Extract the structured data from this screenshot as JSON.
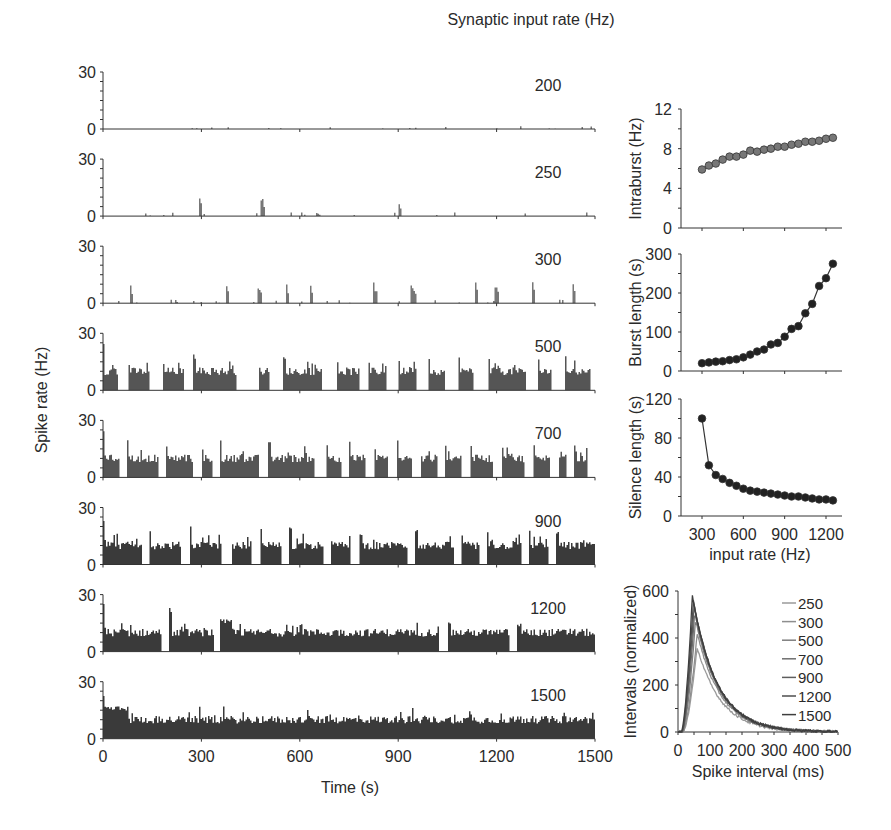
{
  "figure": {
    "header": "Synaptic input rate (Hz)",
    "left_ylabel": "Spike rate (Hz)",
    "left_xlabel": "Time (s)"
  },
  "chart_data": [
    {
      "type": "bar",
      "title": "Spike rate vs time at different synaptic input rates",
      "xlabel": "Time (s)",
      "ylabel": "Spike rate (Hz)",
      "xlim": [
        0,
        1500
      ],
      "ylim": [
        0,
        30
      ],
      "xticks": [
        0,
        300,
        600,
        900,
        1200,
        1500
      ],
      "yticks": [
        0,
        30
      ],
      "panels": [
        {
          "input_rate": "200",
          "pattern": "sparse",
          "bursts": [],
          "noise_level": 1.5
        },
        {
          "input_rate": "250",
          "pattern": "bursts",
          "bursts": [
            [
              290,
              300,
              14
            ],
            [
              480,
              492,
              12
            ],
            [
              897,
              908,
              11
            ]
          ],
          "noise_level": 2
        },
        {
          "input_rate": "300",
          "pattern": "bursts",
          "bursts": [
            [
              80,
              88,
              15
            ],
            [
              372,
              383,
              17
            ],
            [
              468,
              483,
              13
            ],
            [
              555,
              566,
              13
            ],
            [
              628,
              637,
              17
            ],
            [
              822,
              836,
              12
            ],
            [
              936,
              952,
              12
            ],
            [
              1130,
              1140,
              17
            ],
            [
              1192,
              1203,
              15
            ],
            [
              1304,
              1316,
              15
            ],
            [
              1427,
              1440,
              13
            ]
          ],
          "noise_level": 2
        },
        {
          "input_rate": "500",
          "pattern": "bursts",
          "bursts": [
            [
              0,
              14,
              14
            ],
            [
              25,
              45,
              15
            ],
            [
              60,
              80,
              16
            ],
            [
              90,
              133,
              19
            ],
            [
              155,
              166,
              17
            ],
            [
              180,
              218,
              18
            ],
            [
              233,
              255,
              17
            ],
            [
              265,
              282,
              16
            ],
            [
              295,
              313,
              17
            ],
            [
              325,
              341,
              18
            ],
            [
              355,
              370,
              18
            ],
            [
              385,
              422,
              18
            ],
            [
              435,
              448,
              17
            ],
            [
              462,
              487,
              19
            ],
            [
              502,
              530,
              17
            ],
            [
              545,
              568,
              18
            ],
            [
              585,
              600,
              15
            ],
            [
              610,
              645,
              14
            ],
            [
              662,
              678,
              16
            ],
            [
              690,
              710,
              14
            ],
            [
              727,
              758,
              18
            ],
            [
              770,
              800,
              15
            ]
          ],
          "noise_level": 0
        },
        {
          "input_rate": "700",
          "pattern": "bursts",
          "bursts": [
            [
              0,
              15,
              23
            ],
            [
              23,
              55,
              20
            ],
            [
              63,
              89,
              19
            ],
            [
              98,
              108,
              20
            ],
            [
              116,
              155,
              20
            ],
            [
              165,
              210,
              20
            ],
            [
              223,
              237,
              19
            ],
            [
              246,
              262,
              21
            ],
            [
              271,
              284,
              16
            ],
            [
              294,
              308,
              20
            ],
            [
              317,
              333,
              16
            ],
            [
              342,
              358,
              17
            ],
            [
              367,
              389,
              18
            ],
            [
              398,
              420,
              18
            ],
            [
              430,
              446,
              18
            ],
            [
              455,
              463,
              19
            ],
            [
              471,
              483,
              19
            ],
            [
              491,
              503,
              16
            ]
          ],
          "noise_level": 0
        },
        {
          "input_rate": "900",
          "pattern": "bursts",
          "bursts": [
            [
              0,
              38,
              14
            ],
            [
              46,
              77,
              20
            ],
            [
              86,
              118,
              20
            ],
            [
              128,
              148,
              18
            ],
            [
              157,
              178,
              22
            ],
            [
              186,
              219,
              21
            ],
            [
              227,
              247,
              22
            ],
            [
              256,
              303,
              17
            ],
            [
              312,
              350,
              20
            ],
            [
              358,
              375,
              17
            ],
            [
              383,
              418,
              17
            ],
            [
              426,
              445,
              19
            ],
            [
              453,
              495,
              18
            ]
          ],
          "noise_level": 0
        },
        {
          "input_rate": "1200",
          "pattern": "bursts",
          "bursts": [
            [
              0,
              58,
              14
            ],
            [
              66,
              110,
              23
            ],
            [
              117,
              335,
              17
            ],
            [
              344,
              405,
              17
            ],
            [
              413,
              495,
              15
            ]
          ],
          "noise_level": 0
        },
        {
          "input_rate": "1500",
          "pattern": "tonic",
          "bursts": [
            [
              0,
              495,
              17
            ]
          ],
          "noise_level": 0
        }
      ]
    },
    {
      "type": "scatter",
      "title": "Intraburst rate",
      "xlabel": "",
      "ylabel": "Intraburst (Hz)",
      "ylim": [
        0,
        12
      ],
      "yticks": [
        0,
        4,
        8,
        12
      ],
      "xticks": [
        300,
        600,
        900,
        1200
      ],
      "x": [
        300,
        350,
        400,
        450,
        500,
        550,
        600,
        650,
        700,
        750,
        800,
        850,
        900,
        950,
        1000,
        1050,
        1100,
        1150,
        1200,
        1250
      ],
      "y": [
        5.9,
        6.3,
        6.5,
        6.9,
        7.2,
        7.2,
        7.4,
        7.8,
        7.7,
        7.9,
        8.0,
        8.2,
        8.2,
        8.4,
        8.5,
        8.7,
        8.7,
        8.8,
        9.0,
        9.1
      ],
      "marker_color": "#777777",
      "line": false
    },
    {
      "type": "line",
      "title": "Burst length",
      "xlabel": "",
      "ylabel": "Burst length (s)",
      "ylim": [
        0,
        300
      ],
      "yticks": [
        0,
        100,
        200,
        300
      ],
      "xticks": [
        300,
        600,
        900,
        1200
      ],
      "x": [
        300,
        350,
        400,
        450,
        500,
        550,
        600,
        650,
        700,
        750,
        800,
        850,
        900,
        950,
        1000,
        1050,
        1100,
        1150,
        1200,
        1250
      ],
      "y": [
        20,
        22,
        24,
        25,
        28,
        30,
        35,
        42,
        50,
        55,
        68,
        72,
        88,
        108,
        115,
        148,
        172,
        218,
        238,
        275
      ],
      "marker_color": "#222222",
      "line": true
    },
    {
      "type": "line",
      "title": "Silence length",
      "xlabel": "input rate (Hz)",
      "ylabel": "Silence length (s)",
      "ylim": [
        0,
        120
      ],
      "yticks": [
        0,
        40,
        80,
        120
      ],
      "xticks": [
        300,
        600,
        900,
        1200
      ],
      "x": [
        300,
        350,
        400,
        450,
        500,
        550,
        600,
        650,
        700,
        750,
        800,
        850,
        900,
        950,
        1000,
        1050,
        1100,
        1150,
        1200,
        1250
      ],
      "y": [
        100,
        52,
        42,
        38,
        34,
        31,
        28,
        26,
        25,
        24,
        23,
        22,
        21,
        20,
        20,
        19,
        18,
        17,
        17,
        16
      ],
      "marker_color": "#222222",
      "line": true
    },
    {
      "type": "line",
      "title": "Spike interval distribution",
      "xlabel": "Spike interval (ms)",
      "ylabel": "Intervals (normalized)",
      "xlim": [
        0,
        500
      ],
      "ylim": [
        0,
        600
      ],
      "xticks": [
        0,
        100,
        200,
        300,
        400,
        500
      ],
      "yticks": [
        0,
        200,
        400,
        600
      ],
      "legend_position": "upper right",
      "series": [
        {
          "name": "250",
          "peak": 360,
          "peak_x": 60,
          "color": "#9a9a9a"
        },
        {
          "name": "300",
          "peak": 420,
          "peak_x": 60,
          "color": "#8e8e8e"
        },
        {
          "name": "500",
          "peak": 480,
          "peak_x": 55,
          "color": "#7e7e7e"
        },
        {
          "name": "700",
          "peak": 510,
          "peak_x": 52,
          "color": "#6e6e6e"
        },
        {
          "name": "900",
          "peak": 540,
          "peak_x": 50,
          "color": "#5e5e5e"
        },
        {
          "name": "1200",
          "peak": 560,
          "peak_x": 48,
          "color": "#4e4e4e"
        },
        {
          "name": "1500",
          "peak": 580,
          "peak_x": 45,
          "color": "#3e3e3e"
        }
      ]
    }
  ]
}
